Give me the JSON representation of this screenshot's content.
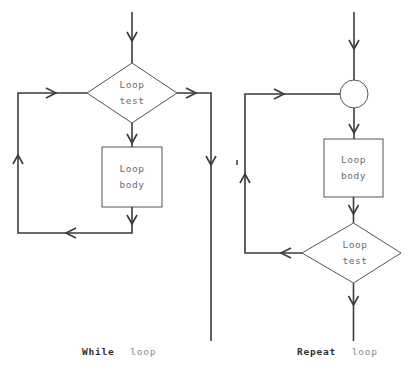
{
  "figure": {
    "background_color": "#ffffff",
    "line_color": "#3a3a3c",
    "shape_stroke_color": "#555558",
    "node_text_color": "#6b6b6e",
    "caption_bold_color": "#2e2e30",
    "caption_light_color": "#8a8a8d"
  },
  "diagrams": [
    {
      "id": "while-loop",
      "caption_bold": "While",
      "caption_light": "loop",
      "caption_full": "While loop",
      "nodes": [
        {
          "id": "while-loop-test",
          "shape": "diamond",
          "line1": "Loop",
          "line2": "test"
        },
        {
          "id": "while-loop-body",
          "shape": "rectangle",
          "line1": "Loop",
          "line2": "body"
        }
      ],
      "edges": [
        {
          "id": "while-entry",
          "from": "start",
          "to": "while-loop-test",
          "direction": "down"
        },
        {
          "id": "while-test-false-exit",
          "from": "while-loop-test",
          "to": "exit",
          "direction": "right-then-down"
        },
        {
          "id": "while-test-true-to-body",
          "from": "while-loop-test",
          "to": "while-loop-body",
          "direction": "down"
        },
        {
          "id": "while-body-feedback",
          "from": "while-loop-body",
          "to": "while-loop-test",
          "direction": "down-left-up-right"
        }
      ]
    },
    {
      "id": "repeat-loop",
      "caption_bold": "Repeat",
      "caption_light": "loop",
      "caption_full": "Repeat loop",
      "nodes": [
        {
          "id": "repeat-junction",
          "shape": "circle",
          "line1": "",
          "line2": ""
        },
        {
          "id": "repeat-loop-body",
          "shape": "rectangle",
          "line1": "Loop",
          "line2": "body"
        },
        {
          "id": "repeat-loop-test",
          "shape": "diamond",
          "line1": "Loop",
          "line2": "test"
        }
      ],
      "edges": [
        {
          "id": "repeat-entry",
          "from": "start",
          "to": "repeat-junction",
          "direction": "down"
        },
        {
          "id": "repeat-junction-to-body",
          "from": "repeat-junction",
          "to": "repeat-loop-body",
          "direction": "down"
        },
        {
          "id": "repeat-body-to-test",
          "from": "repeat-loop-body",
          "to": "repeat-loop-test",
          "direction": "down"
        },
        {
          "id": "repeat-test-feedback",
          "from": "repeat-loop-test",
          "to": "repeat-junction",
          "direction": "left-up-right"
        },
        {
          "id": "repeat-test-exit",
          "from": "repeat-loop-test",
          "to": "exit",
          "direction": "down"
        }
      ]
    }
  ]
}
